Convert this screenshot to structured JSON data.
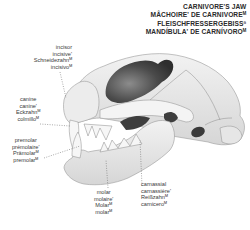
{
  "title": {
    "lines": [
      "CARNIVORE'S JAW",
      "MÂCHOIRE' DE CARNIVOREᴹ",
      "FLEISCHFRESSERGEBISSⁿ",
      "MANDÍBULA' DE CARNÍVOROᴹ"
    ]
  },
  "labels": {
    "incisor": [
      "incisor",
      "incisive'",
      "Schneidezahnᴹ",
      "incisivoᴹ"
    ],
    "canine": [
      "canine",
      "canine'",
      "Eckzahnᴹ",
      "colmilloᴹ"
    ],
    "premolar": [
      "premolar",
      "prémolaire'",
      "Prämolarᴹ",
      "premolarᴹ"
    ],
    "molar": [
      "molar",
      "molaire'",
      "Molarᴹ",
      "molarᴹ"
    ],
    "carnassial": [
      "carnassial",
      "carnassière'",
      "Reißzahnᴹ",
      "carniceroᴹ"
    ]
  },
  "colors": {
    "background": "#ffffff",
    "text": "#3a3a3a",
    "bone": "#e9e9e9",
    "bone_shadow": "#bdbdbd",
    "cavity": "#4a4a4a",
    "outline": "#8a8a8a"
  }
}
